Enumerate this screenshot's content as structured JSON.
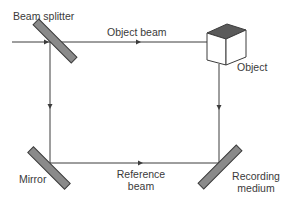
{
  "diagram": {
    "title": "",
    "type": "holography-recording-setup",
    "labels": {
      "beam_splitter": "Beam splitter",
      "object_beam": "Object beam",
      "object": "Object",
      "mirror": "Mirror",
      "reference_beam_line1": "Reference",
      "reference_beam_line2": "beam",
      "recording_medium_line1": "Recording",
      "recording_medium_line2": "medium"
    },
    "colors": {
      "line": "#3c3c3c",
      "optic_fill": "#8a8a8a",
      "cube_top": "#5a5a5a",
      "text": "#3a3a3a"
    },
    "nodes": [
      {
        "id": "beam-splitter",
        "label": "Beam splitter"
      },
      {
        "id": "object",
        "label": "Object"
      },
      {
        "id": "mirror",
        "label": "Mirror"
      },
      {
        "id": "recording-medium",
        "label": "Recording medium"
      }
    ],
    "edges": [
      {
        "from": "source",
        "to": "beam-splitter",
        "label": ""
      },
      {
        "from": "beam-splitter",
        "to": "object",
        "label": "Object beam"
      },
      {
        "from": "object",
        "to": "recording-medium",
        "label": ""
      },
      {
        "from": "beam-splitter",
        "to": "mirror",
        "label": ""
      },
      {
        "from": "mirror",
        "to": "recording-medium",
        "label": "Reference beam"
      }
    ]
  }
}
